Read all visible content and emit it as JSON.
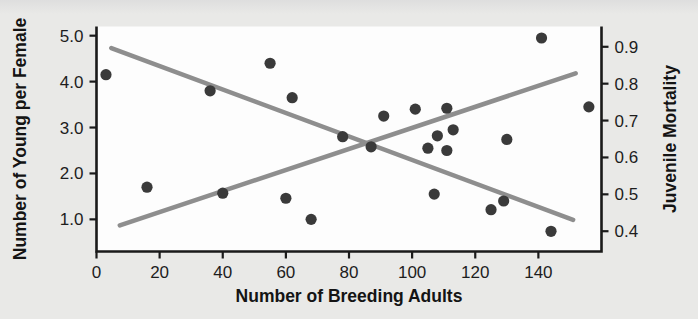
{
  "figure": {
    "background_color": "#e9e9e7",
    "plot_area_color": "#fdfdfd",
    "point_color": "#3a3a3a",
    "trendline_color": "#8e8e8e",
    "axis_color": "#1a1a1a"
  },
  "chart_data": {
    "type": "scatter",
    "title": "",
    "xlabel": "Number of Breeding Adults",
    "ylabel": "Number of Young per Female",
    "y2label": "Juvenile Mortality",
    "xlim": [
      0,
      160
    ],
    "ylim": [
      0.3,
      5.2
    ],
    "y2lim": [
      0.345,
      0.955
    ],
    "xticks": [
      0,
      20,
      40,
      60,
      80,
      100,
      120,
      140
    ],
    "xticklabels": [
      "0",
      "20",
      "40",
      "60",
      "80",
      "100",
      "120",
      "140"
    ],
    "yticks": [
      1.0,
      2.0,
      3.0,
      4.0,
      5.0
    ],
    "yticklabels": [
      "1.0",
      "2.0",
      "3.0",
      "4.0",
      "5.0"
    ],
    "y2ticks": [
      0.4,
      0.5,
      0.6,
      0.7,
      0.8,
      0.9
    ],
    "y2ticklabels": [
      "0.4",
      "0.5",
      "0.6",
      "0.7",
      "0.8",
      "0.9"
    ],
    "grid": false,
    "legend": null,
    "series": [
      {
        "name": "Number of Young per Female",
        "axis": "left",
        "marker": "circle",
        "points": [
          {
            "x": 3,
            "y": 4.15
          },
          {
            "x": 36,
            "y": 3.8
          },
          {
            "x": 55,
            "y": 4.4
          },
          {
            "x": 62,
            "y": 3.65
          },
          {
            "x": 78,
            "y": 2.8
          },
          {
            "x": 87,
            "y": 2.58
          },
          {
            "x": 91,
            "y": 3.25
          },
          {
            "x": 101,
            "y": 3.4
          },
          {
            "x": 105,
            "y": 2.55
          },
          {
            "x": 108,
            "y": 2.82
          },
          {
            "x": 111,
            "y": 3.42
          },
          {
            "x": 111,
            "y": 2.5
          },
          {
            "x": 113,
            "y": 2.95
          },
          {
            "x": 130,
            "y": 2.74
          },
          {
            "x": 141,
            "y": 4.95
          },
          {
            "x": 156,
            "y": 3.45
          }
        ]
      },
      {
        "name": "Juvenile Mortality",
        "axis": "right",
        "marker": "circle",
        "points": [
          {
            "x": 16,
            "y": 1.7
          },
          {
            "x": 40,
            "y": 1.57
          },
          {
            "x": 60,
            "y": 1.46
          },
          {
            "x": 68,
            "y": 1.0
          },
          {
            "x": 107,
            "y": 1.55
          },
          {
            "x": 125,
            "y": 1.21
          },
          {
            "x": 129,
            "y": 1.4
          },
          {
            "x": 144,
            "y": 0.74
          }
        ]
      }
    ],
    "trendlines": [
      {
        "name": "young-per-female-trend",
        "direction": "decreasing",
        "x_start": 4.7,
        "y_start": 4.73,
        "x_end": 151,
        "y_end": 0.99
      },
      {
        "name": "juvenile-mortality-trend",
        "direction": "increasing",
        "x_start": 7.4,
        "y_start": 0.87,
        "x_end": 151.8,
        "y_end": 4.18
      }
    ]
  }
}
